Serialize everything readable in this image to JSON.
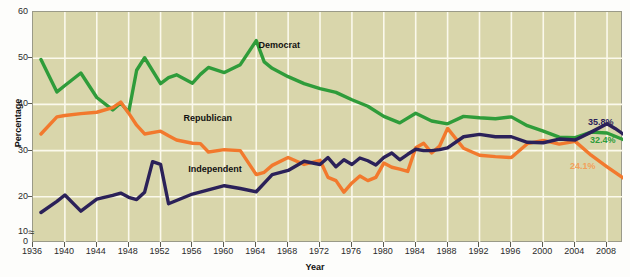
{
  "chart_data": {
    "type": "line",
    "title": "",
    "xlabel": "Year",
    "ylabel": "Percentage",
    "xlim": [
      1936,
      2010
    ],
    "ylim": [
      10,
      60
    ],
    "y_axis_break": true,
    "y_ticks": [
      0,
      10,
      20,
      30,
      40,
      50,
      60
    ],
    "x_ticks": [
      1936,
      1940,
      1944,
      1948,
      1952,
      1956,
      1960,
      1964,
      1968,
      1972,
      1976,
      1980,
      1984,
      1988,
      1992,
      1996,
      2000,
      2004,
      2008
    ],
    "grid": true,
    "legend_position": "inline-annotations",
    "plot_background": "#d9d6ab",
    "series": [
      {
        "name": "Democrat",
        "color": "#2f9c3a",
        "label_x": 1964.4,
        "label_y": 52.6,
        "end_label": "32.4%",
        "end_label_color": "#2f9c3a",
        "x": [
          1937,
          1939,
          1940,
          1942,
          1944,
          1946,
          1947,
          1948,
          1949,
          1950,
          1952,
          1953,
          1954,
          1956,
          1957,
          1958,
          1960,
          1962,
          1964,
          1965,
          1966,
          1968,
          1970,
          1972,
          1974,
          1976,
          1978,
          1980,
          1982,
          1984,
          1986,
          1988,
          1990,
          1992,
          1994,
          1996,
          1998,
          2000,
          2002,
          2004,
          2006,
          2008,
          2010
        ],
        "y": [
          49.7,
          42.7,
          44.1,
          46.8,
          41.5,
          38.8,
          40.3,
          38.3,
          47.4,
          50.1,
          44.5,
          45.8,
          46.4,
          44.6,
          46.5,
          48.0,
          46.9,
          48.6,
          53.8,
          49.2,
          47.8,
          46.0,
          44.5,
          43.4,
          42.6,
          41.0,
          39.6,
          37.4,
          36.0,
          38.1,
          36.4,
          35.8,
          37.4,
          37.1,
          36.9,
          37.3,
          35.4,
          34.2,
          32.9,
          32.8,
          34.0,
          33.8,
          32.4
        ]
      },
      {
        "name": "Republican",
        "color": "#f2792d",
        "label_x": 1955.0,
        "label_y": 36.8,
        "end_label": "24.1%",
        "end_label_color": "#f2a05a",
        "x": [
          1937,
          1939,
          1940,
          1942,
          1944,
          1946,
          1947,
          1948,
          1949,
          1950,
          1952,
          1953,
          1954,
          1956,
          1957,
          1958,
          1960,
          1962,
          1964,
          1965,
          1966,
          1968,
          1970,
          1972,
          1973,
          1974,
          1975,
          1976,
          1977,
          1978,
          1979,
          1980,
          1981,
          1982,
          1983,
          1984,
          1985,
          1986,
          1987,
          1988,
          1990,
          1992,
          1994,
          1996,
          1998,
          2000,
          2002,
          2004,
          2006,
          2008,
          2010
        ],
        "y": [
          33.6,
          37.3,
          37.6,
          38.0,
          38.3,
          39.3,
          40.5,
          38.1,
          35.5,
          33.6,
          34.2,
          33.2,
          32.3,
          31.6,
          31.5,
          29.7,
          30.2,
          30.0,
          24.8,
          25.3,
          26.8,
          28.5,
          27.0,
          27.9,
          24.2,
          23.5,
          21.0,
          23.0,
          24.5,
          23.5,
          24.2,
          27.3,
          26.4,
          26.0,
          25.5,
          30.6,
          31.6,
          29.5,
          31.0,
          34.8,
          30.5,
          29.0,
          28.7,
          28.5,
          31.5,
          32.2,
          31.4,
          32.0,
          29.0,
          26.5,
          24.1
        ]
      },
      {
        "name": "Independent",
        "color": "#2b2159",
        "label_x": 1955.6,
        "label_y": 25.8,
        "end_label": "35.8%",
        "end_label_color": "#2b2159",
        "x": [
          1937,
          1939,
          1940,
          1942,
          1944,
          1946,
          1947,
          1948,
          1949,
          1950,
          1951,
          1952,
          1953,
          1954,
          1956,
          1958,
          1960,
          1962,
          1964,
          1966,
          1968,
          1970,
          1972,
          1973,
          1974,
          1975,
          1976,
          1977,
          1978,
          1979,
          1980,
          1981,
          1982,
          1983,
          1984,
          1985,
          1986,
          1987,
          1988,
          1990,
          1992,
          1994,
          1996,
          1998,
          2000,
          2002,
          2004,
          2006,
          2008,
          2009,
          2010
        ],
        "y": [
          16.6,
          19.0,
          20.4,
          16.9,
          19.5,
          20.3,
          20.8,
          19.9,
          19.4,
          21.0,
          27.6,
          27.0,
          18.5,
          19.2,
          20.6,
          21.5,
          22.4,
          21.8,
          21.1,
          24.8,
          25.7,
          27.7,
          27.0,
          28.5,
          26.5,
          28.0,
          27.0,
          28.4,
          27.8,
          26.9,
          28.5,
          29.5,
          28.0,
          29.2,
          30.3,
          30.0,
          30.0,
          30.2,
          30.6,
          33.0,
          33.5,
          33.0,
          33.0,
          31.8,
          31.7,
          32.5,
          32.3,
          34.0,
          35.8,
          34.8,
          33.6
        ]
      }
    ],
    "annotations": [
      {
        "text": "Democrat",
        "color": "#111111"
      },
      {
        "text": "Republican",
        "color": "#111111"
      },
      {
        "text": "Independent",
        "color": "#111111"
      },
      {
        "text": "35.8%",
        "color": "#2b2159"
      },
      {
        "text": "32.4%",
        "color": "#2f9c3a"
      },
      {
        "text": "24.1%",
        "color": "#f2a05a"
      }
    ]
  },
  "axis": {
    "y_title": "Percentage",
    "x_title": "Year",
    "zero_label": "0"
  }
}
